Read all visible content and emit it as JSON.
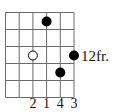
{
  "diagram": {
    "type": "guitar-chord-diagram",
    "strings": 6,
    "frets_shown": 5,
    "position_label": "12fr.",
    "dots": [
      {
        "string": 4,
        "fret": 1,
        "style": "filled"
      },
      {
        "string": 3,
        "fret": 3,
        "style": "open"
      },
      {
        "string": 6,
        "fret": 3,
        "style": "filled"
      },
      {
        "string": 5,
        "fret": 4,
        "style": "filled"
      }
    ],
    "fingering": [
      {
        "string": 3,
        "finger": "2"
      },
      {
        "string": 4,
        "finger": "1"
      },
      {
        "string": 5,
        "finger": "4"
      },
      {
        "string": 6,
        "finger": "3"
      }
    ],
    "colors": {
      "line": "#555555",
      "dot": "#000000",
      "background": "#ffffff"
    }
  }
}
